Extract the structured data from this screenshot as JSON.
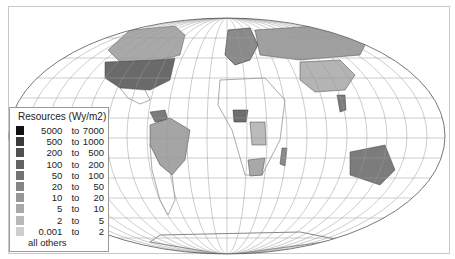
{
  "legend": {
    "title": "Resources (Wy/m2)",
    "classes": [
      {
        "from": "5000",
        "to_word": "to",
        "to": "7000",
        "color": "#111111"
      },
      {
        "from": "500",
        "to_word": "to",
        "to": "1000",
        "color": "#3a3a3a"
      },
      {
        "from": "200",
        "to_word": "to",
        "to": "500",
        "color": "#505050"
      },
      {
        "from": "100",
        "to_word": "to",
        "to": "200",
        "color": "#626262"
      },
      {
        "from": "50",
        "to_word": "to",
        "to": "100",
        "color": "#737373"
      },
      {
        "from": "20",
        "to_word": "to",
        "to": "50",
        "color": "#858585"
      },
      {
        "from": "10",
        "to_word": "to",
        "to": "20",
        "color": "#969696"
      },
      {
        "from": "5",
        "to_word": "to",
        "to": "10",
        "color": "#a8a8a8"
      },
      {
        "from": "2",
        "to_word": "to",
        "to": "5",
        "color": "#b8b8b8"
      },
      {
        "from": "0.001",
        "to_word": "to",
        "to": "2",
        "color": "#cecece"
      }
    ],
    "others_label": "all others"
  },
  "map": {
    "projection": "pseudo-cylindrical (elliptical) world map with graticule",
    "shaded_regions": [
      {
        "name": "United States",
        "shade": "#6a6a6a"
      },
      {
        "name": "Canada",
        "shade": "#a9a9a9"
      },
      {
        "name": "Russia",
        "shade": "#a0a0a0"
      },
      {
        "name": "China",
        "shade": "#b4b4b4"
      },
      {
        "name": "Brazil",
        "shade": "#a5a5a5"
      },
      {
        "name": "Australia",
        "shade": "#7c7c7c"
      },
      {
        "name": "Nigeria",
        "shade": "#6e6e6e"
      },
      {
        "name": "DR Congo",
        "shade": "#bbbbbb"
      },
      {
        "name": "South Africa",
        "shade": "#a8a8a8"
      },
      {
        "name": "Madagascar",
        "shade": "#8a8a8a"
      },
      {
        "name": "Venezuela",
        "shade": "#7a7a7a"
      },
      {
        "name": "Thailand",
        "shade": "#7a7a7a"
      },
      {
        "name": "Western Europe",
        "shade": "#8a8a8a"
      }
    ]
  }
}
